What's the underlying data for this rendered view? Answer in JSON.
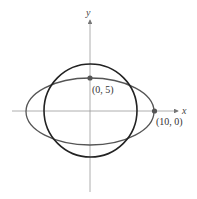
{
  "diagram": {
    "axes": {
      "x_label": "x",
      "y_label": "y",
      "color": "#888888"
    },
    "curves": [
      {
        "name": "ellipse",
        "equation_hint": "x^2/100 + y^2/25 = 1",
        "semi_major": 10,
        "semi_minor": 5,
        "color": "#555555"
      },
      {
        "name": "circle",
        "color": "#222222"
      }
    ],
    "points": [
      {
        "label": "(0, 5)",
        "x": 0,
        "y": 5
      },
      {
        "label": "(10, 0)",
        "x": 10,
        "y": 0
      }
    ]
  }
}
